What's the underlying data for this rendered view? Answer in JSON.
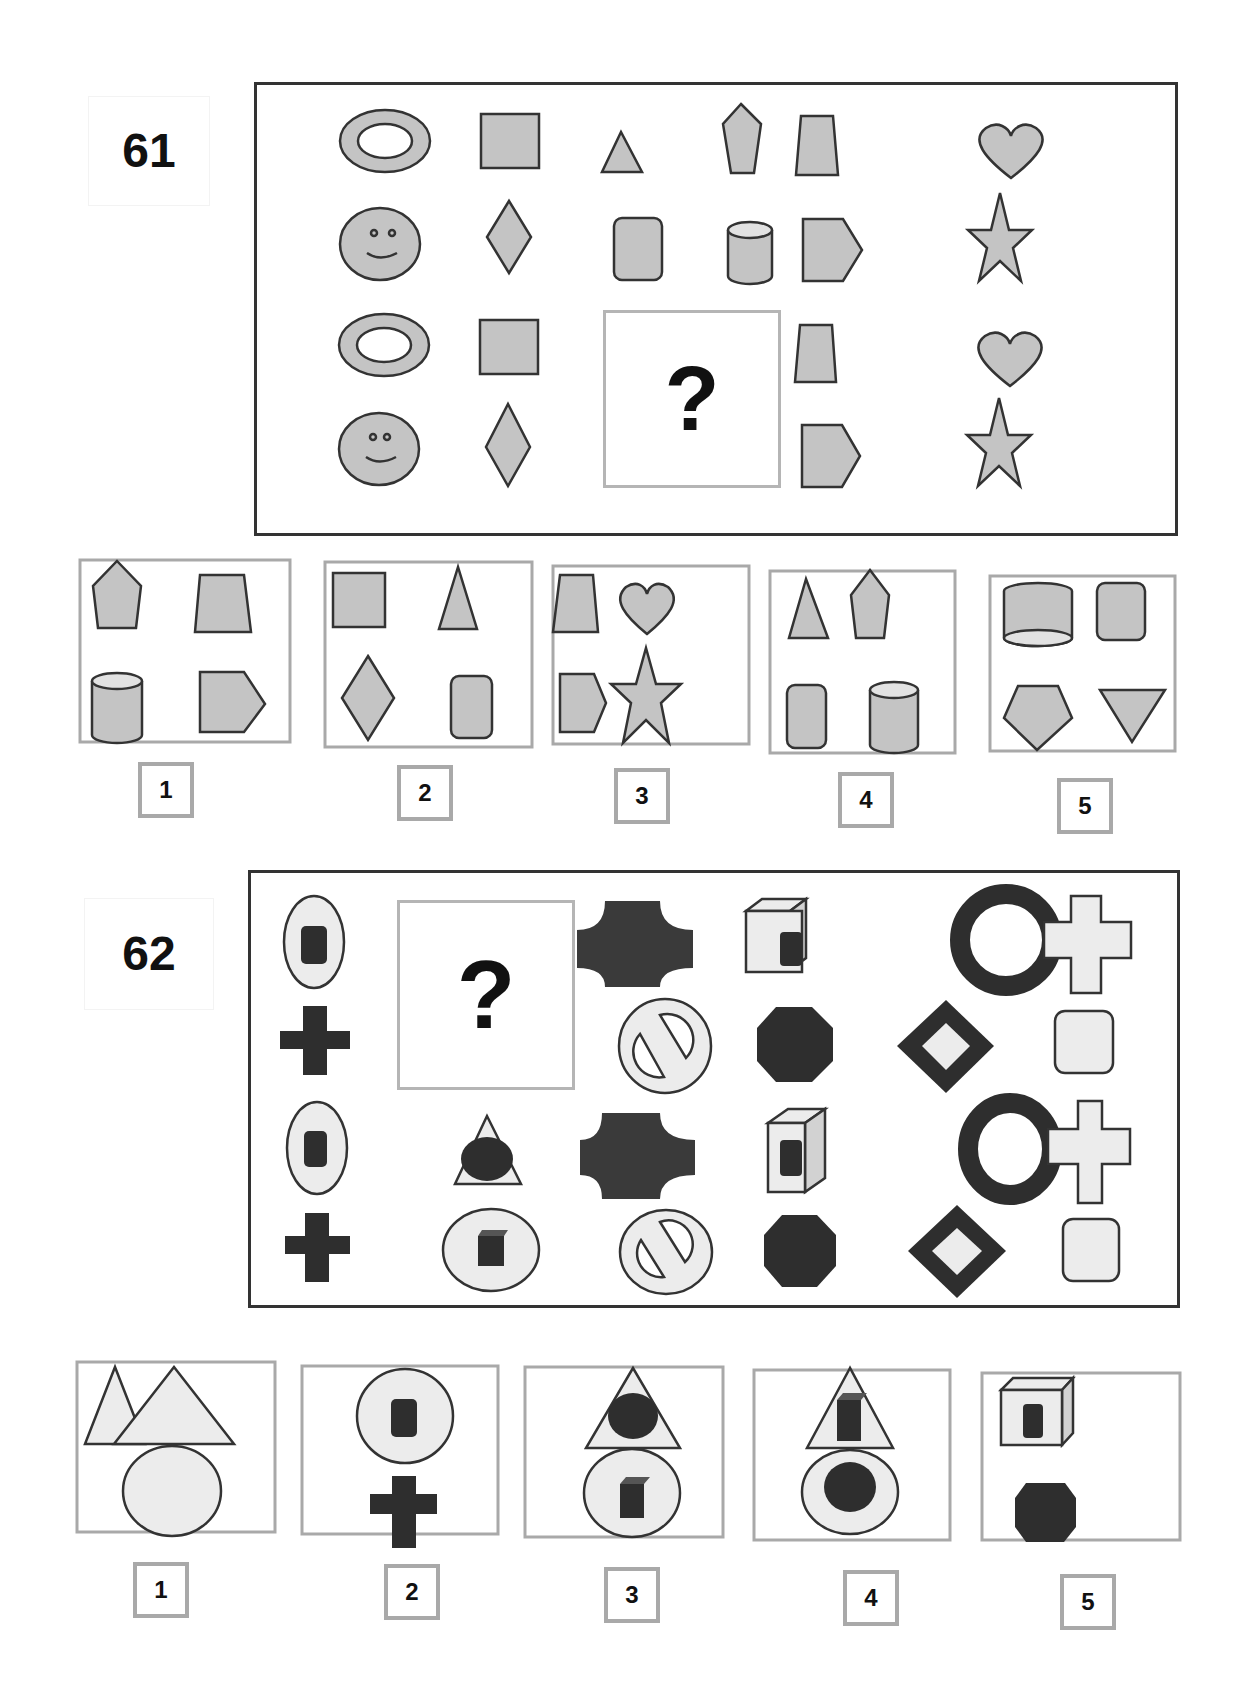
{
  "puzzle_61": {
    "number": "61",
    "missing_marker": "?",
    "grid": {
      "row_1": [
        "ring-oval",
        "rectangle",
        "triangle",
        "pentagon",
        "trapezoid",
        "heart"
      ],
      "row_2": [
        "smiley-face",
        "diamond",
        "rounded-square",
        "cylinder",
        "arrow-pentagon",
        "star"
      ],
      "row_3": [
        "ring-oval",
        "rectangle",
        "?",
        "?",
        "trapezoid",
        "heart"
      ],
      "row_4": [
        "smiley-face",
        "diamond",
        "?",
        "?",
        "arrow-pentagon",
        "star"
      ]
    },
    "options": [
      {
        "label": "1",
        "shapes": [
          "pentagon",
          "trapezoid",
          "cylinder",
          "arrow-pentagon"
        ]
      },
      {
        "label": "2",
        "shapes": [
          "rectangle",
          "triangle",
          "diamond",
          "rounded-square"
        ]
      },
      {
        "label": "3",
        "shapes": [
          "trapezoid",
          "heart",
          "arrow-pentagon",
          "star"
        ]
      },
      {
        "label": "4",
        "shapes": [
          "triangle",
          "pentagon",
          "rounded-square",
          "cylinder"
        ]
      },
      {
        "label": "5",
        "shapes": [
          "inverted-cylinder",
          "rounded-square",
          "inverted-pentagon",
          "inverted-triangle"
        ]
      }
    ]
  },
  "puzzle_62": {
    "number": "62",
    "missing_marker": "?",
    "grid": {
      "row_1": [
        "oval-with-dark-square",
        "?",
        "dark-concave-cross",
        "box-with-dark-square",
        "dark-ring",
        "light-cross"
      ],
      "row_2": [
        "dark-cross",
        "?",
        "prohibition-sign",
        "dark-octagon",
        "dark-diamond-frame",
        "light-rounded-square"
      ],
      "row_3": [
        "oval-with-dark-square",
        "triangle-with-dark-oval",
        "dark-concave-cross",
        "box-with-dark-square",
        "dark-ring",
        "light-cross"
      ],
      "row_4": [
        "dark-cross",
        "oval-with-dark-cube",
        "prohibition-sign",
        "dark-octagon",
        "dark-diamond-frame",
        "light-rounded-square"
      ]
    },
    "options": [
      {
        "label": "1",
        "shapes": [
          "light-triangle",
          "light-oval"
        ]
      },
      {
        "label": "2",
        "shapes": [
          "oval-with-dark-square",
          "dark-cross"
        ]
      },
      {
        "label": "3",
        "shapes": [
          "triangle-with-dark-oval",
          "oval-with-dark-cube"
        ]
      },
      {
        "label": "4",
        "shapes": [
          "triangle-with-dark-cube",
          "oval-with-dark-oval"
        ]
      },
      {
        "label": "5",
        "shapes": [
          "box-with-dark-square",
          "dark-octagon"
        ]
      }
    ]
  },
  "colors": {
    "shape_fill_grey": "#c4c4c4",
    "shape_fill_light": "#ececec",
    "shape_dark": "#2e2e2e",
    "outline": "#333333",
    "option_border": "#a9a9a9"
  }
}
